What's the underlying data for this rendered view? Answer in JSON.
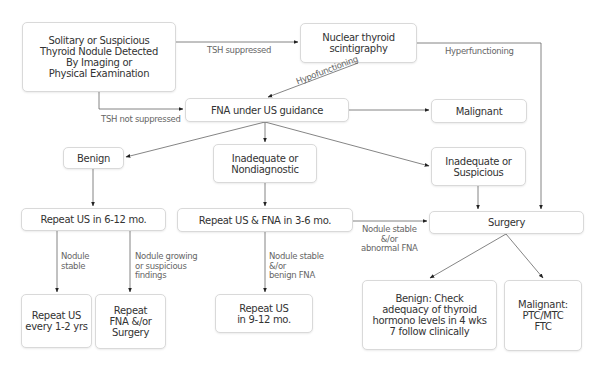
{
  "nodes": {
    "start": "Solitary or Suspicious\nThyroid Nodule Detected\nBy Imaging or\nPhysical Examination",
    "scintigraphy": "Nuclear thyroid\nscintigraphy",
    "fna": "FNA under US guidance",
    "malignant_top": "Malignant",
    "benign": "Benign",
    "inadequate_nondiagnostic": "Inadequate or\nNondiagnostic",
    "inadequate_suspicious": "Inadequate or\nSuspicious",
    "repeat_us_6_12": "Repeat US in 6-12 mo.",
    "repeat_us_fna_3_6": "Repeat US & FNA in 3-6 mo.",
    "surgery": "Surgery",
    "repeat_us_1_2": "Repeat US\nevery 1-2 yrs",
    "repeat_fna_surgery": "Repeat\nFNA &/or\nSurgery",
    "repeat_us_9_12": "Repeat US\nin 9-12 mo.",
    "benign_check": "Benign: Check\nadequacy of thyroid\nhormono levels in 4 wks\n7 follow clinically",
    "malignant_types": "Malignant:\nPTC/MTC\nFTC"
  },
  "edge_labels": {
    "tsh_suppressed": "TSH suppressed",
    "tsh_not_suppressed": "TSH not suppressed",
    "hyperfunctioning": "Hyperfunctioning",
    "hypofunctioning": "Hypofunctioning",
    "nodule_stable": "Nodule\nstable",
    "nodule_growing": "Nodule growing\nor suspicious\nfindings",
    "nodule_stable_benign": "Nodule stable\n&/or\nbenign FNA",
    "nodule_stable_abnormal": "Nodule stable\n&/or\nabnormal FNA"
  },
  "colors": {
    "line": "#555555",
    "box_border": "#d9d9d9",
    "text": "#333333",
    "label": "#666666"
  }
}
